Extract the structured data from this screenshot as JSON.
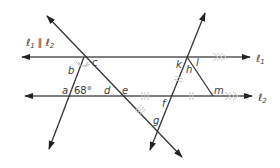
{
  "diagram": {
    "parallel_statement": {
      "l1": "ℓ",
      "l1_sub": "1",
      "parallel_symbol": "∥",
      "l2": "ℓ",
      "l2_sub": "2"
    },
    "line_labels": {
      "l1": "ℓ",
      "l1_sub": "1",
      "l2": "ℓ",
      "l2_sub": "2"
    },
    "angle_labels": {
      "a": "a",
      "b": "b",
      "c": "c",
      "d": "d",
      "e": "e",
      "f": "f",
      "g": "g",
      "h": "h",
      "k": "k",
      "l": "l",
      "m": "m"
    },
    "given_angle": "68°",
    "colors": {
      "line": "#333333",
      "parallel_line": "#555555",
      "tick_marks": "#c8c8c8",
      "label": "#3a3a3a"
    }
  }
}
